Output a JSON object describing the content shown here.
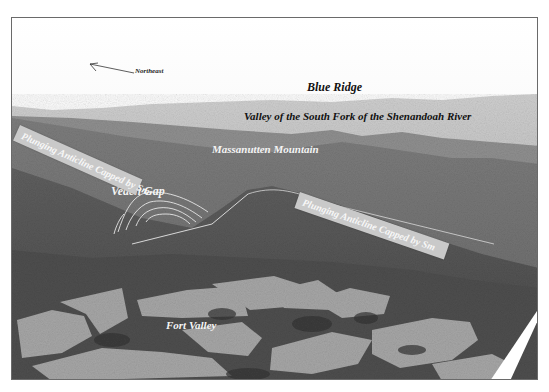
{
  "figure": {
    "type": "annotated aerial photograph (grayscale)",
    "colors": {
      "sky": "#f6f6f6",
      "haze": "#bdbdbd",
      "far_ridge": "#8f8f8f",
      "mid_ridge": "#747474",
      "forest": "#5e5e5e",
      "dark_forest": "#3e3e3e",
      "field": "#a9a9a9",
      "banner": "#c9c9c9",
      "frame": "#6a6a6a"
    }
  },
  "orientation": {
    "label": "Northeast",
    "arrow_icon": "north-east-arrow"
  },
  "labels": {
    "blue_ridge": "Blue Ridge",
    "valley_south_fork": "Valley of the South Fork of the Shenandoah River",
    "massanutten": "Massanutten Mountain",
    "veach_gap": "Veach Gap",
    "fort_valley": "Fort Valley"
  },
  "banners": {
    "left": "Plunging Anticline Capped by Sm",
    "right": "Plunging Anticline Capped by Sm"
  }
}
